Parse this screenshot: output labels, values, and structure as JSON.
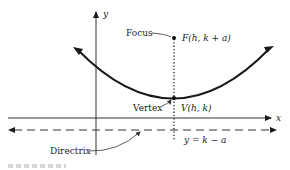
{
  "diagram": {
    "type": "parabola-focus-directrix",
    "axes": {
      "x_label": "x",
      "y_label": "y"
    },
    "labels": {
      "focus_name": "Focus",
      "focus_coord": "F(h, k + a)",
      "vertex_name": "Vertex",
      "vertex_coord": "V(h, k)",
      "directrix_name": "Directrix",
      "directrix_eq": "y = k − a"
    },
    "colors": {
      "ink": "#1a1a1a",
      "axis": "#333333",
      "label": "#222222"
    }
  }
}
